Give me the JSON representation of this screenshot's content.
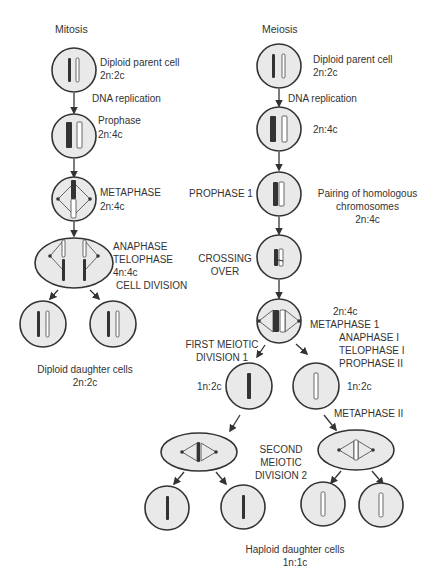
{
  "mitosis": {
    "title": "Mitosis",
    "parent": {
      "label": "Diploid parent cell",
      "ploidy": "2n:2c"
    },
    "replication": "DNA replication",
    "prophase": {
      "label": "Prophase",
      "ploidy": "2n:4c"
    },
    "metaphase": {
      "label": "METAPHASE",
      "ploidy": "2n:4c"
    },
    "anaphase": {
      "label1": "ANAPHASE",
      "label2": "TELOPHASE",
      "ploidy": "4n:4c"
    },
    "division": "CELL DIVISION",
    "daughters": {
      "label": "Diploid daughter cells",
      "ploidy": "2n:2c"
    }
  },
  "meiosis": {
    "title": "Meiosis",
    "parent": {
      "label": "Diploid parent cell",
      "ploidy": "2n:2c"
    },
    "replication": "DNA replication",
    "replicated": {
      "ploidy": "2n:4c"
    },
    "prophase1": {
      "label": "PROPHASE 1",
      "desc1": "Pairing of homologous",
      "desc2": "chromosomes",
      "ploidy": "2n:4c"
    },
    "crossing": {
      "label1": "CROSSING",
      "label2": "OVER"
    },
    "metaphase1": {
      "ploidy": "2n:4c",
      "label": "METAPHASE 1"
    },
    "first_division": {
      "label1": "FIRST MEIOTIC",
      "label2": "DIVISION 1"
    },
    "anaphase1": {
      "label1": "ANAPHASE I",
      "label2": "TELOPHASE I",
      "label3": "PROPHASE II"
    },
    "haploid_left": {
      "ploidy": "1n:2c"
    },
    "haploid_right": {
      "ploidy": "1n:2c"
    },
    "metaphase2": {
      "label": "METAPHASE II"
    },
    "second_division": {
      "label1": "SECOND",
      "label2": "MEIOTIC",
      "label3": "DIVISION 2"
    },
    "daughters": {
      "label": "Haploid daughter cells",
      "ploidy": "1n:1c"
    }
  },
  "colors": {
    "cell_fill": "#e9e9e9",
    "outline": "#333333"
  }
}
